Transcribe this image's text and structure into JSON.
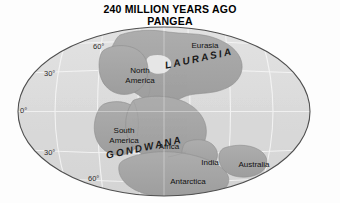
{
  "title": {
    "line1": "240 MILLION YEARS AGO",
    "line2": "PANGEA"
  },
  "map": {
    "projection": "mollweide-ellipse",
    "colors": {
      "background": "#fdfdfd",
      "ocean": "#dcdcdc",
      "land": "#a8a8a8",
      "land_shadow": "#9a9a9a",
      "graticule": "#f2f2f2",
      "outline": "#4a4a4a",
      "label_text": "#111111"
    },
    "latitude_labels": [
      {
        "text": "60°",
        "x": 93,
        "y": 42
      },
      {
        "text": "30°",
        "x": 44,
        "y": 69
      },
      {
        "text": "0°",
        "x": 20,
        "y": 106
      },
      {
        "text": "30°",
        "x": 44,
        "y": 148
      },
      {
        "text": "60°",
        "x": 88,
        "y": 174
      }
    ],
    "continent_labels": [
      {
        "name": "eurasia",
        "text": "Eurasia",
        "x": 183,
        "y": 41,
        "width": 44
      },
      {
        "name": "north-america",
        "text": "North\nAmerica",
        "x": 116,
        "y": 66,
        "width": 48
      },
      {
        "name": "south-america",
        "text": "South\nAmerica",
        "x": 100,
        "y": 126,
        "width": 48
      },
      {
        "name": "africa",
        "text": "Africa",
        "x": 152,
        "y": 142,
        "width": 34
      },
      {
        "name": "india",
        "text": "India",
        "x": 196,
        "y": 158,
        "width": 28
      },
      {
        "name": "australia",
        "text": "Australia",
        "x": 232,
        "y": 160,
        "width": 44
      },
      {
        "name": "antarctica",
        "text": "Antarctica",
        "x": 162,
        "y": 177,
        "width": 52
      }
    ],
    "supercontinent_labels": [
      {
        "name": "laurasia",
        "text": "LAURASIA",
        "x": 164,
        "y": 60,
        "rotate": -12
      },
      {
        "name": "gondwana",
        "text": "GONDWANA",
        "x": 105,
        "y": 150,
        "rotate": -12
      }
    ]
  }
}
